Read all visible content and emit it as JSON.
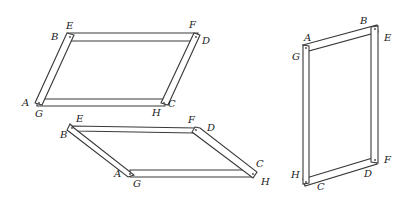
{
  "figure": {
    "colors": {
      "stroke": "#3a3a3a",
      "fill": "#ffffff",
      "text": "#222222"
    }
  },
  "frames": [
    {
      "id": "frame-1",
      "position": "top-left",
      "labels": {
        "E": "E",
        "B": "B",
        "F": "F",
        "D": "D",
        "A": "A",
        "G": "G",
        "H": "H",
        "C": "C"
      }
    },
    {
      "id": "frame-2",
      "position": "bottom-left",
      "labels": {
        "E": "E",
        "B": "B",
        "F": "F",
        "D": "D",
        "A": "A",
        "G": "G",
        "H": "H",
        "C": "C"
      }
    },
    {
      "id": "frame-3",
      "position": "right",
      "labels": {
        "A": "A",
        "B": "B",
        "E": "E",
        "G": "G",
        "H": "H",
        "C": "C",
        "D": "D",
        "F": "F"
      }
    }
  ]
}
